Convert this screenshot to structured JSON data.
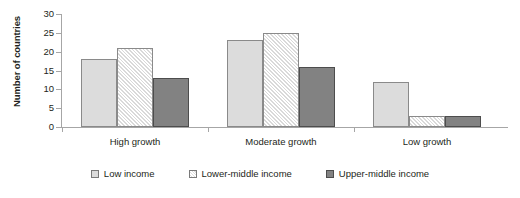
{
  "chart_data": {
    "type": "bar",
    "title": "",
    "subtitle": "",
    "xlabel": "",
    "ylabel": "Number of countries",
    "categories": [
      "High growth",
      "Moderate growth",
      "Low growth"
    ],
    "series": [
      {
        "name": "Low income",
        "values": [
          18,
          23,
          12
        ],
        "swatch": "light-gray-solid",
        "color": "#dcdcdc"
      },
      {
        "name": "Lower-middle income",
        "values": [
          21,
          25,
          3
        ],
        "swatch": "diagonal-hatch",
        "color": "#ffffff"
      },
      {
        "name": "Upper-middle income",
        "values": [
          13,
          16,
          3
        ],
        "swatch": "dark-gray-solid",
        "color": "#828282"
      }
    ],
    "ylim": [
      0,
      30
    ],
    "ytick_labels": [
      "0",
      "5",
      "10",
      "15",
      "20",
      "25",
      "30"
    ],
    "ytick_values": [
      0,
      5,
      10,
      15,
      20,
      25,
      30
    ],
    "grid": false,
    "legend_position": "bottom"
  },
  "axis": {
    "y_title": "Number of countries"
  },
  "legend": {
    "items": [
      {
        "label": "Low income"
      },
      {
        "label": "Lower-middle income"
      },
      {
        "label": "Upper-middle income"
      }
    ]
  }
}
